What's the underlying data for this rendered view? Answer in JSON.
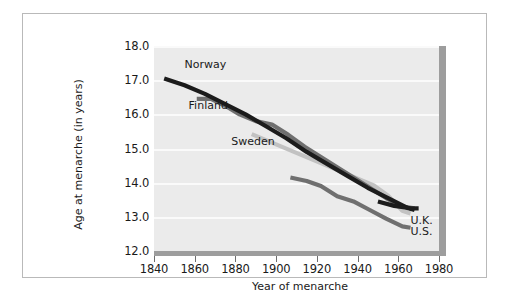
{
  "chart_data": {
    "type": "line",
    "title": "",
    "xlabel": "Year of menarche",
    "ylabel": "Age at menarche (in years)",
    "xlim": [
      1840,
      1980
    ],
    "ylim": [
      12.0,
      18.0
    ],
    "xticks": [
      1840,
      1860,
      1880,
      1900,
      1920,
      1940,
      1960,
      1980
    ],
    "yticks": [
      12.0,
      13.0,
      14.0,
      15.0,
      16.0,
      17.0,
      18.0
    ],
    "xtick_labels": [
      "1840",
      "1860",
      "1880",
      "1900",
      "1920",
      "1940",
      "1960",
      "1980"
    ],
    "ytick_labels": [
      "12.0",
      "13.0",
      "14.0",
      "15.0",
      "16.0",
      "17.0",
      "18.0"
    ],
    "grid": "horizontal-white",
    "legend": "inline-annotations",
    "series": [
      {
        "name": "Norway",
        "color": "#1c1c1c",
        "label_x": 1855,
        "label_y": 17.45,
        "points": [
          [
            1845,
            17.05
          ],
          [
            1855,
            16.85
          ],
          [
            1865,
            16.6
          ],
          [
            1875,
            16.3
          ],
          [
            1885,
            16.0
          ],
          [
            1895,
            15.65
          ],
          [
            1905,
            15.3
          ],
          [
            1915,
            14.9
          ],
          [
            1925,
            14.55
          ],
          [
            1935,
            14.2
          ],
          [
            1945,
            13.85
          ],
          [
            1955,
            13.55
          ],
          [
            1965,
            13.25
          ],
          [
            1968,
            13.2
          ]
        ]
      },
      {
        "name": "Finland",
        "color": "#6f6f6f",
        "label_x": 1857,
        "label_y": 16.25,
        "points": [
          [
            1861,
            16.45
          ],
          [
            1868,
            16.45
          ],
          [
            1875,
            16.25
          ],
          [
            1882,
            16.0
          ],
          [
            1890,
            15.8
          ],
          [
            1898,
            15.7
          ],
          [
            1906,
            15.4
          ],
          [
            1914,
            15.05
          ],
          [
            1922,
            14.75
          ],
          [
            1930,
            14.45
          ],
          [
            1938,
            14.15
          ],
          [
            1946,
            13.85
          ],
          [
            1954,
            13.55
          ],
          [
            1962,
            13.3
          ],
          [
            1968,
            13.25
          ]
        ]
      },
      {
        "name": "Sweden",
        "color": "#c2c2c2",
        "label_x": 1878,
        "label_y": 15.2,
        "points": [
          [
            1888,
            15.42
          ],
          [
            1900,
            15.12
          ],
          [
            1912,
            14.82
          ],
          [
            1924,
            14.52
          ],
          [
            1936,
            14.22
          ],
          [
            1948,
            13.92
          ],
          [
            1955,
            13.62
          ],
          [
            1962,
            13.18
          ],
          [
            1966,
            13.1
          ]
        ]
      },
      {
        "name": "U.K.",
        "color": "#1c1c1c",
        "label_x": 1966,
        "label_y": 12.88,
        "points": [
          [
            1950,
            13.45
          ],
          [
            1958,
            13.32
          ],
          [
            1966,
            13.25
          ],
          [
            1970,
            13.25
          ]
        ]
      },
      {
        "name": "U.S.",
        "color": "#6f6f6f",
        "label_x": 1966,
        "label_y": 12.55,
        "points": [
          [
            1907,
            14.15
          ],
          [
            1915,
            14.05
          ],
          [
            1922,
            13.9
          ],
          [
            1930,
            13.6
          ],
          [
            1938,
            13.45
          ],
          [
            1946,
            13.2
          ],
          [
            1954,
            12.95
          ],
          [
            1962,
            12.72
          ],
          [
            1966,
            12.68
          ]
        ]
      }
    ]
  },
  "colors": {
    "plot_background": "#ebebeb",
    "gridline": "#fafafa",
    "axis_bar": "#9d9d9d",
    "frame_border": "#b9b9b9",
    "text": "#1a1a1a"
  }
}
